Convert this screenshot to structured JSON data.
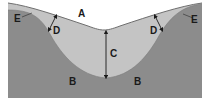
{
  "diagram": {
    "type": "valley cross-section",
    "colors": {
      "background": "#ffffff",
      "bedrock": "#8c8c8c",
      "fill_layer": "#c4c4c4",
      "surface_line": "#6e6e6e",
      "arrow": "#1a1a1a",
      "label": "#1a1a1a"
    },
    "labels": {
      "A": "A",
      "B_left": "B",
      "B_right": "B",
      "C": "C",
      "D_left": "D",
      "D_right": "D",
      "E_left": "E",
      "E_right": "E"
    }
  }
}
